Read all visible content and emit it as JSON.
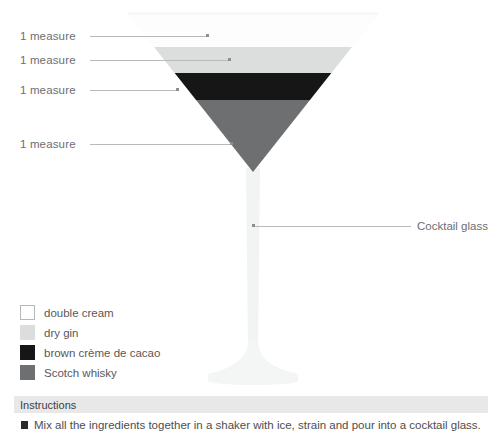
{
  "diagram": {
    "measures": [
      {
        "label": "1 measure",
        "ingredient": "double cream",
        "color": "#fdfdfd"
      },
      {
        "label": "1 measure",
        "ingredient": "dry gin",
        "color": "#dcdddd"
      },
      {
        "label": "1 measure",
        "ingredient": "brown crème de cacao",
        "color": "#161616"
      },
      {
        "label": "1 measure",
        "ingredient": "Scotch whisky",
        "color": "#6e6f71"
      }
    ],
    "glass_callout": "Cocktail glass",
    "glass_color": "#f2f3f3"
  },
  "legend": {
    "items": [
      {
        "label": "double cream",
        "color": "#ffffff",
        "border": "#b6b7b9"
      },
      {
        "label": "dry gin",
        "color": "#dcdddd",
        "border": "#dcdddd"
      },
      {
        "label": "brown crème de cacao",
        "color": "#161616",
        "border": "#161616"
      },
      {
        "label": "Scotch whisky",
        "color": "#6e6f71",
        "border": "#6e6f71"
      }
    ]
  },
  "instructions": {
    "header": "Instructions",
    "steps": [
      "Mix all the ingredients together in a shaker with ice, strain and pour into a cocktail glass."
    ]
  }
}
